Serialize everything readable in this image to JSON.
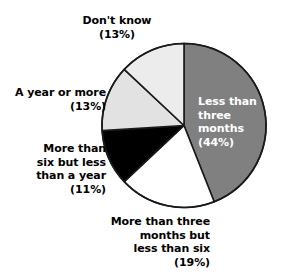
{
  "chart_data": {
    "type": "pie",
    "title": "",
    "xlabel": "",
    "ylabel": "",
    "legend_position": "none",
    "grid": false,
    "start_angle_deg": 0,
    "direction": "clockwise",
    "categories": [
      "Less than three months",
      "More than three months but less than six",
      "More than six but less than a year",
      "A year or more",
      "Don't know"
    ],
    "values": [
      44,
      19,
      11,
      13,
      13
    ],
    "units": "%",
    "slice_colors": [
      "#808080",
      "#ffffff",
      "#000000",
      "#e2e2e2",
      "#ececec"
    ],
    "slice_edge_color": "#1a1a1a",
    "slices": [
      {
        "name": "less-than-three-months",
        "label": "Less than\nthree\nmonths\n(44%)",
        "text": "Less than three months",
        "percent_text": "(44%)",
        "value": 44,
        "color": "#808080",
        "label_color": "#ffffff",
        "label_placement": "inside"
      },
      {
        "name": "three-to-six-months",
        "label": "More than three\nmonths but\nless than six\n(19%)",
        "text": "More than three months but less than six",
        "percent_text": "(19%)",
        "value": 19,
        "color": "#ffffff",
        "label_color": "#000000",
        "label_placement": "outside-bottom"
      },
      {
        "name": "six-months-to-year",
        "label": "More than\nsix but less\nthan a year\n(11%)",
        "text": "More than six but less than a year",
        "percent_text": "(11%)",
        "value": 11,
        "color": "#000000",
        "label_color": "#000000",
        "label_placement": "outside-left"
      },
      {
        "name": "a-year-or-more",
        "label": "A year or more\n(13%)",
        "text": "A year or more",
        "percent_text": "(13%)",
        "value": 13,
        "color": "#e2e2e2",
        "label_color": "#000000",
        "label_placement": "outside-left"
      },
      {
        "name": "dont-know",
        "label": "Don't know\n(13%)",
        "text": "Don't know",
        "percent_text": "(13%)",
        "value": 13,
        "color": "#ececec",
        "label_color": "#000000",
        "label_placement": "outside-top"
      }
    ]
  },
  "geometry": {
    "center_x": 184,
    "center_y": 125.5,
    "radius": 82
  }
}
